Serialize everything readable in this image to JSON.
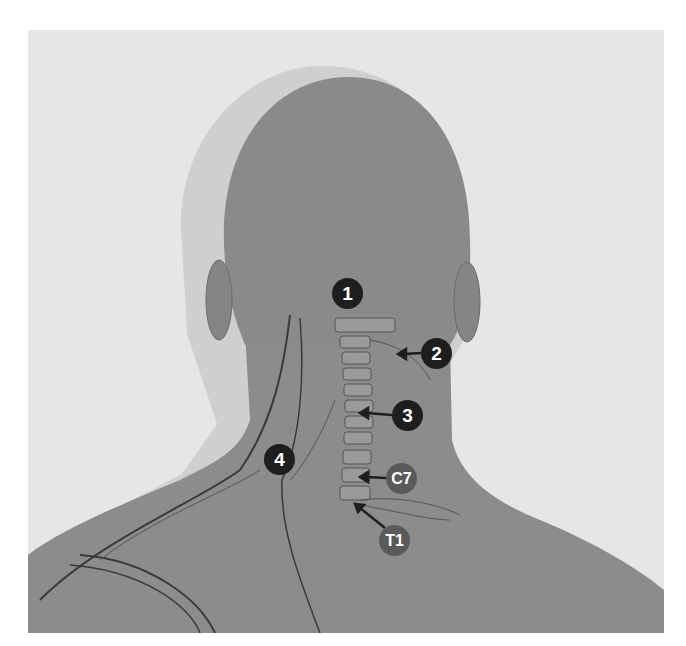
{
  "figure": {
    "colors": {
      "background": "#e6e6e6",
      "skin": "#8a8a8a",
      "skin_light": "#9a9a9a",
      "outline": "#3a3a3a",
      "marker_dark": "#1e1e1e",
      "marker_gray": "#5a5a5a"
    },
    "markers": [
      {
        "label": "1",
        "style": "dark",
        "x": 347,
        "y": 293,
        "arrow": null
      },
      {
        "label": "2",
        "style": "dark",
        "x": 436,
        "y": 353,
        "arrow": {
          "to_x": 400,
          "to_y": 354
        }
      },
      {
        "label": "3",
        "style": "dark",
        "x": 407,
        "y": 415,
        "arrow": {
          "to_x": 362,
          "to_y": 413
        }
      },
      {
        "label": "4",
        "style": "dark",
        "x": 279,
        "y": 459,
        "arrow": null
      },
      {
        "label": "C7",
        "style": "gray",
        "x": 401,
        "y": 478,
        "arrow": {
          "to_x": 362,
          "to_y": 477
        }
      },
      {
        "label": "T1",
        "style": "gray",
        "x": 394,
        "y": 540,
        "arrow": {
          "to_x": 355,
          "to_y": 505
        }
      }
    ]
  }
}
